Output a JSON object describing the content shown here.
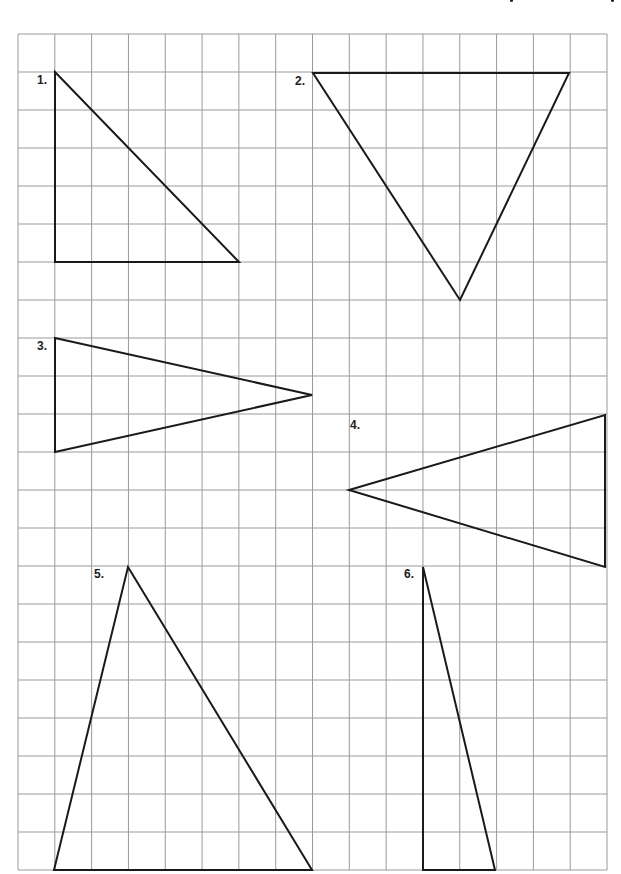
{
  "page": {
    "header_cut_off": true,
    "header_fragments": [
      {
        "x": 510,
        "w": 3
      },
      {
        "x": 611,
        "w": 3
      }
    ]
  },
  "grid": {
    "x0": 18,
    "y0": 34,
    "x1": 607,
    "y1": 870,
    "cols": 16,
    "rows": 22,
    "line_color": "#9a9a9a",
    "line_width": 1
  },
  "shapes": {
    "stroke_color": "#1a1a1a",
    "stroke_width": 2,
    "triangles": [
      {
        "label": "1.",
        "points": [
          [
            55,
            72
          ],
          [
            55,
            262
          ],
          [
            239,
            262
          ]
        ],
        "label_pos": [
          37,
          73
        ]
      },
      {
        "label": "2.",
        "points": [
          [
            313,
            73
          ],
          [
            569,
            73
          ],
          [
            460,
            300
          ]
        ],
        "label_pos": [
          295,
          74
        ]
      },
      {
        "label": "3.",
        "points": [
          [
            55,
            338
          ],
          [
            312,
            395
          ],
          [
            55,
            452
          ]
        ],
        "label_pos": [
          37,
          339
        ]
      },
      {
        "label": "4.",
        "points": [
          [
            349,
            490
          ],
          [
            605,
            415
          ],
          [
            605,
            567
          ]
        ],
        "label_pos": [
          350,
          418
        ]
      },
      {
        "label": "5.",
        "points": [
          [
            128,
            567
          ],
          [
            312,
            870
          ],
          [
            54,
            870
          ]
        ],
        "label_pos": [
          94,
          567
        ]
      },
      {
        "label": "6.",
        "points": [
          [
            423,
            567
          ],
          [
            495,
            870
          ],
          [
            423,
            870
          ]
        ],
        "label_pos": [
          404,
          567
        ]
      }
    ]
  }
}
